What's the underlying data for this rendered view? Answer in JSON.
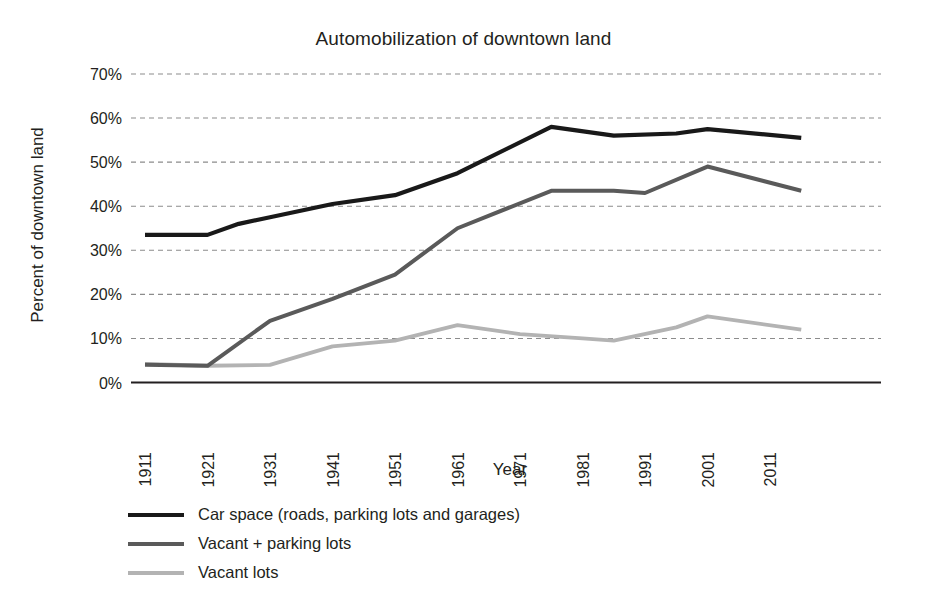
{
  "chart_data": {
    "type": "line",
    "title": "Automobilization of downtown land",
    "xlabel": "Year",
    "ylabel": "Percent of downtown land",
    "xlim": [
      1911,
      2016
    ],
    "ylim": [
      0,
      70
    ],
    "ytick_labels": [
      "0%",
      "10%",
      "20%",
      "30%",
      "40%",
      "50%",
      "60%",
      "70%"
    ],
    "ytick_values": [
      0,
      10,
      20,
      30,
      40,
      50,
      60,
      70
    ],
    "xtick_labels": [
      "1911",
      "1921",
      "1931",
      "1941",
      "1951",
      "1961",
      "1971",
      "1981",
      "1991",
      "2001",
      "2011"
    ],
    "xtick_values": [
      1911,
      1921,
      1931,
      1941,
      1951,
      1961,
      1971,
      1981,
      1991,
      2001,
      2011
    ],
    "grid": "horizontal-dashed",
    "legend_position": "below-left",
    "series": [
      {
        "name": "Car space (roads, parking lots and garages)",
        "color": "#191919",
        "width": 4.2,
        "x": [
          1911,
          1921,
          1926,
          1931,
          1941,
          1951,
          1961,
          1976,
          1986,
          1996,
          2001,
          2016
        ],
        "values": [
          33.5,
          33.5,
          36.0,
          37.5,
          40.5,
          42.5,
          47.5,
          58.0,
          56.0,
          56.5,
          57.5,
          55.5
        ]
      },
      {
        "name": "Vacant + parking lots",
        "color": "#5a5a5a",
        "width": 4.0,
        "x": [
          1911,
          1921,
          1931,
          1941,
          1951,
          1961,
          1976,
          1986,
          1991,
          2001,
          2016
        ],
        "values": [
          4.0,
          3.8,
          14.0,
          19.0,
          24.5,
          35.0,
          43.5,
          43.5,
          43.0,
          49.0,
          43.5
        ]
      },
      {
        "name": "Vacant lots",
        "color": "#b3b3b3",
        "width": 3.8,
        "x": [
          1911,
          1921,
          1931,
          1941,
          1951,
          1961,
          1971,
          1981,
          1986,
          1996,
          2001,
          2016
        ],
        "values": [
          4.2,
          3.8,
          4.0,
          8.2,
          9.5,
          13.0,
          11.0,
          10.0,
          9.5,
          12.5,
          15.0,
          12.0
        ]
      }
    ]
  },
  "axis": {
    "axis_line_color": "#231f20",
    "grid_color": "#8c8c8c"
  }
}
